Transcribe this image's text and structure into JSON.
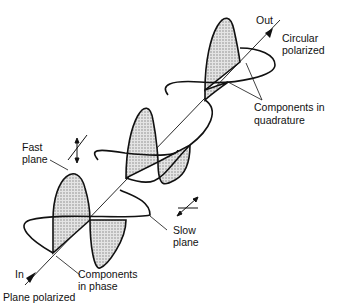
{
  "diagram": {
    "labels": {
      "out": "Out",
      "circular_1": "Circular",
      "circular_2": "polarized",
      "fast_1": "Fast",
      "fast_2": "plane",
      "slow_1": "Slow",
      "slow_2": "plane",
      "quad_1": "Components in",
      "quad_2": "quadrature",
      "phase_1": "Components",
      "phase_2": "in phase",
      "in": "In",
      "plane_polarized": "Plane polarized"
    },
    "icons": [
      "fast-axis-symbol",
      "slow-axis-symbol",
      "propagation-arrow"
    ],
    "colors": {
      "line": "#111111",
      "fill": "#bdbdbd"
    }
  }
}
